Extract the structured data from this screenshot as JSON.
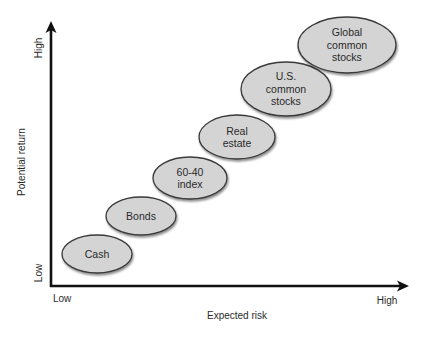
{
  "diagram": {
    "type": "risk-return-diagram",
    "y_axis": {
      "title": "Potential return",
      "low_label": "Low",
      "high_label": "High"
    },
    "x_axis": {
      "title": "Expected risk",
      "low_label": "Low",
      "high_label": "High"
    },
    "assets": [
      {
        "name": "Cash",
        "lines": [
          "Cash"
        ],
        "cx": 97,
        "cy": 254,
        "rx": 35,
        "ry": 19
      },
      {
        "name": "Bonds",
        "lines": [
          "Bonds"
        ],
        "cx": 141,
        "cy": 216,
        "rx": 35,
        "ry": 19
      },
      {
        "name": "60-40 index",
        "lines": [
          "60-40",
          "index"
        ],
        "cx": 190,
        "cy": 178,
        "rx": 37,
        "ry": 21
      },
      {
        "name": "Real estate",
        "lines": [
          "Real",
          "estate"
        ],
        "cx": 237,
        "cy": 137,
        "rx": 38,
        "ry": 22
      },
      {
        "name": "U.S. common stocks",
        "lines": [
          "U.S.",
          "common",
          "stocks"
        ],
        "cx": 286,
        "cy": 89,
        "rx": 45,
        "ry": 27
      },
      {
        "name": "Global common stocks",
        "lines": [
          "Global",
          "common",
          "stocks"
        ],
        "cx": 347,
        "cy": 45,
        "rx": 49,
        "ry": 28
      }
    ],
    "colors": {
      "bubble_fill": "#d4d4d4",
      "bubble_stroke": "#3a3a3a",
      "axis": "#111111",
      "text": "#2a2a2a"
    }
  }
}
